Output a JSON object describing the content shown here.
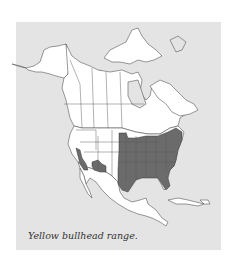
{
  "figure": {
    "caption": "Yellow bullhead range.",
    "map_region": "North America",
    "legend": {
      "range_label": "Yellow bullhead range"
    },
    "colors": {
      "background": "#ffffff",
      "panel": "#e4e4e4",
      "land": "#ffffff",
      "range": "#6b6b6b",
      "border": "#555555"
    }
  }
}
